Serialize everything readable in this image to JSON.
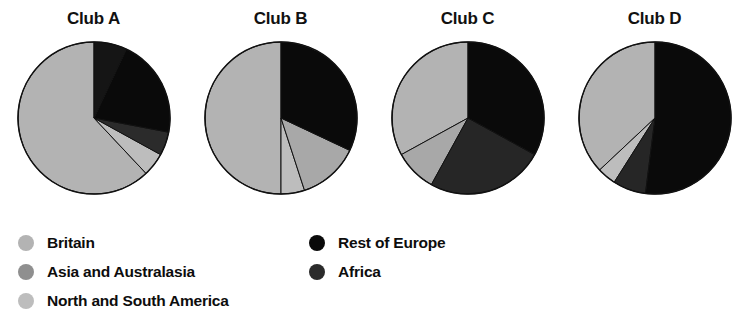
{
  "chart_data": {
    "type": "pie",
    "title": "",
    "subtitle": "",
    "xlabel": "",
    "ylabel": "",
    "grid": false,
    "legend_position": "bottom",
    "units": "percent",
    "categories": [
      "Britain",
      "Asia and Australasia",
      "North and South America",
      "Rest of Europe",
      "Africa"
    ],
    "category_colors": [
      "#b3b3b3",
      "#8f8f8f",
      "#bdbdbd",
      "#0a0a0a",
      "#2b2b2b"
    ],
    "charts": [
      {
        "title": "Club A",
        "slices": [
          {
            "label": "Britain",
            "value": 62,
            "color": "#b3b3b3"
          },
          {
            "label": "North and South America",
            "value": 5,
            "color": "#bdbdbd"
          },
          {
            "label": "Africa",
            "value": 5,
            "color": "#2b2b2b"
          },
          {
            "label": "Rest of Europe",
            "value": 21,
            "color": "#0a0a0a"
          },
          {
            "label": "Asia and Australasia",
            "value": 7,
            "color": "#151515"
          }
        ]
      },
      {
        "title": "Club B",
        "slices": [
          {
            "label": "Britain",
            "value": 50,
            "color": "#b3b3b3"
          },
          {
            "label": "North and South America",
            "value": 5,
            "color": "#bdbdbd"
          },
          {
            "label": "Asia and Australasia",
            "value": 13,
            "color": "#a8a8a8"
          },
          {
            "label": "Rest of Europe",
            "value": 32,
            "color": "#0a0a0a"
          }
        ]
      },
      {
        "title": "Club C",
        "slices": [
          {
            "label": "Britain",
            "value": 33,
            "color": "#b3b3b3"
          },
          {
            "label": "Asia and Australasia",
            "value": 9,
            "color": "#a8a8a8"
          },
          {
            "label": "Africa",
            "value": 25,
            "color": "#262626"
          },
          {
            "label": "Rest of Europe",
            "value": 33,
            "color": "#0a0a0a"
          }
        ]
      },
      {
        "title": "Club D",
        "slices": [
          {
            "label": "Britain",
            "value": 37,
            "color": "#b3b3b3"
          },
          {
            "label": "North and South America",
            "value": 4,
            "color": "#bdbdbd"
          },
          {
            "label": "Africa",
            "value": 7,
            "color": "#262626"
          },
          {
            "label": "Rest of Europe",
            "value": 52,
            "color": "#0a0a0a"
          }
        ]
      }
    ]
  },
  "titles": {
    "club_a": "Club A",
    "club_b": "Club B",
    "club_c": "Club C",
    "club_d": "Club D"
  },
  "legend": {
    "left_column": [
      {
        "label": "Britain",
        "color": "#b3b3b3"
      },
      {
        "label": "Asia and Australasia",
        "color": "#8f8f8f"
      },
      {
        "label": "North and South America",
        "color": "#bdbdbd"
      }
    ],
    "right_column": [
      {
        "label": "Rest of Europe",
        "color": "#0a0a0a"
      },
      {
        "label": "Africa",
        "color": "#2b2b2b"
      }
    ]
  }
}
